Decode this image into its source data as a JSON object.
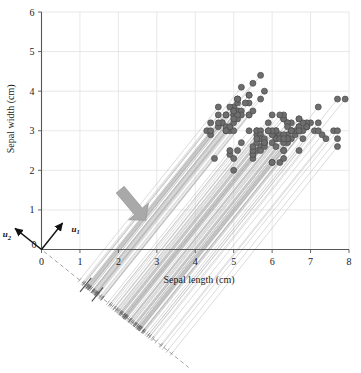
{
  "figure": {
    "type": "pca-projection-scatter",
    "background": "#ffffff"
  },
  "axes": {
    "x": {
      "label": "Sepal length (cm)",
      "ticks": [
        0,
        1,
        2,
        3,
        4,
        5,
        6,
        7,
        8
      ],
      "min": 0,
      "max": 8
    },
    "y": {
      "label": "Sepal width (cm)",
      "ticks": [
        0,
        1,
        2,
        3,
        4,
        5,
        6
      ],
      "min": 0,
      "max": 6
    },
    "origin_label": "0",
    "grid": true,
    "grid_color": "#e2e2e2",
    "axis_color": "#555555"
  },
  "vectors": [
    {
      "name": "u1",
      "label": "u",
      "sub": "1",
      "dx": 0.62,
      "dy": 0.78,
      "length_px": 34
    },
    {
      "name": "u2",
      "label": "u",
      "sub": "2",
      "dx": -0.78,
      "dy": 0.62,
      "length_px": 34
    }
  ],
  "annotations": {
    "arrow": {
      "name": "projection-direction-arrow",
      "color": "#a8a8a8",
      "angle_deg": 50
    },
    "projection_axis": {
      "name": "principal-component-axis",
      "style": "dashed",
      "color": "#9a9a9a",
      "angle_deg": -38.7
    }
  },
  "style": {
    "point_fill": "#6e6e6e",
    "point_stroke": "#4a4a4a",
    "point_radius": 3.0,
    "projection_line_color": "#b4b4b4",
    "tick_mark_color": "#5a5a5a"
  },
  "chart_data": {
    "type": "scatter",
    "title": "",
    "xlabel": "Sepal length (cm)",
    "ylabel": "Sepal width (cm)",
    "xlim": [
      0,
      8
    ],
    "ylim": [
      0,
      6
    ],
    "xticks": [
      0,
      1,
      2,
      3,
      4,
      5,
      6,
      7,
      8
    ],
    "yticks": [
      0,
      1,
      2,
      3,
      4,
      5,
      6
    ],
    "grid": true,
    "legend": "none",
    "series": [
      {
        "name": "Iris samples",
        "x": [
          5.1,
          4.9,
          4.7,
          4.6,
          5.0,
          5.4,
          4.6,
          5.0,
          4.4,
          4.9,
          5.4,
          4.8,
          4.8,
          4.3,
          5.8,
          5.7,
          5.4,
          5.1,
          5.7,
          5.1,
          5.4,
          5.1,
          4.6,
          5.1,
          4.8,
          5.0,
          5.0,
          5.2,
          5.2,
          4.7,
          4.8,
          5.4,
          5.2,
          5.5,
          4.9,
          5.0,
          5.5,
          4.9,
          4.4,
          5.1,
          5.0,
          4.5,
          4.4,
          5.0,
          5.1,
          4.8,
          5.1,
          4.6,
          5.3,
          5.0,
          7.0,
          6.4,
          6.9,
          5.5,
          6.5,
          5.7,
          6.3,
          4.9,
          6.6,
          5.2,
          5.0,
          5.9,
          6.0,
          6.1,
          5.6,
          6.7,
          5.6,
          5.8,
          6.2,
          5.6,
          5.9,
          6.1,
          6.3,
          6.1,
          6.4,
          6.6,
          6.8,
          6.7,
          6.0,
          5.7,
          5.5,
          5.5,
          5.8,
          6.0,
          5.4,
          6.0,
          6.7,
          6.3,
          5.6,
          5.5,
          5.5,
          6.1,
          5.8,
          5.0,
          5.6,
          5.7,
          5.7,
          6.2,
          5.1,
          5.7,
          6.3,
          5.8,
          7.1,
          6.3,
          6.5,
          7.6,
          4.9,
          7.3,
          6.7,
          7.2,
          6.5,
          6.4,
          6.8,
          5.7,
          5.8,
          6.4,
          6.5,
          7.7,
          7.7,
          6.0,
          6.9,
          5.6,
          7.7,
          6.3,
          6.7,
          7.2,
          6.2,
          6.1,
          6.4,
          7.2,
          7.4,
          7.9,
          6.4,
          6.3,
          6.1,
          7.7,
          6.3,
          6.4,
          6.0,
          6.9,
          6.7,
          6.9,
          5.8,
          6.8,
          6.7,
          6.7,
          6.3,
          6.5,
          6.2,
          5.9
        ],
        "y": [
          3.5,
          3.0,
          3.2,
          3.1,
          3.6,
          3.9,
          3.4,
          3.4,
          2.9,
          3.1,
          3.7,
          3.4,
          3.0,
          3.0,
          4.0,
          4.4,
          3.9,
          3.5,
          3.8,
          3.8,
          3.4,
          3.7,
          3.6,
          3.3,
          3.4,
          3.0,
          3.4,
          3.5,
          3.4,
          3.2,
          3.1,
          3.4,
          4.1,
          4.2,
          3.1,
          3.2,
          3.5,
          3.6,
          3.0,
          3.4,
          3.5,
          2.3,
          3.2,
          3.5,
          3.8,
          3.0,
          3.8,
          3.2,
          3.7,
          3.3,
          3.2,
          3.2,
          3.1,
          2.3,
          2.8,
          2.8,
          3.3,
          2.4,
          2.9,
          2.7,
          2.0,
          3.0,
          2.2,
          2.9,
          2.9,
          3.1,
          3.0,
          2.7,
          2.2,
          2.5,
          3.2,
          2.8,
          2.5,
          2.8,
          2.9,
          3.0,
          2.8,
          3.0,
          2.9,
          2.6,
          2.4,
          2.4,
          2.7,
          2.7,
          3.0,
          3.4,
          3.1,
          2.3,
          3.0,
          2.5,
          2.6,
          3.0,
          2.6,
          2.3,
          2.7,
          3.0,
          2.9,
          2.9,
          2.5,
          2.8,
          3.3,
          2.7,
          3.0,
          2.9,
          3.0,
          3.0,
          2.5,
          2.9,
          2.5,
          3.6,
          3.2,
          2.7,
          3.0,
          2.5,
          2.8,
          3.2,
          3.0,
          3.8,
          2.6,
          2.2,
          3.2,
          2.8,
          2.8,
          2.7,
          3.3,
          3.2,
          2.8,
          3.0,
          2.8,
          3.0,
          2.8,
          3.8,
          2.8,
          2.8,
          2.6,
          3.0,
          3.4,
          3.1,
          3.0,
          3.1,
          3.1,
          3.1,
          2.7,
          3.2,
          3.3,
          3.0,
          2.5,
          3.0,
          3.4,
          3.0
        ]
      }
    ]
  }
}
